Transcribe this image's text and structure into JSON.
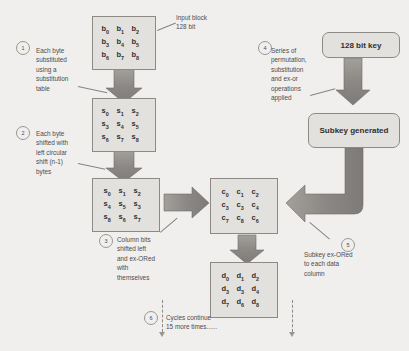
{
  "diagram": {
    "background_color": "#f1efed",
    "box_fill": "#e3e1de",
    "box_border": "#8d8a86",
    "arrow_color": "#8b8885"
  },
  "boxes": {
    "input_block": {
      "name": "input-block-matrix",
      "rows": [
        [
          "b0",
          "b1",
          "b2"
        ],
        [
          "b3",
          "b4",
          "b5"
        ],
        [
          "b6",
          "b7",
          "b8"
        ]
      ]
    },
    "substituted": {
      "name": "substituted-matrix",
      "rows": [
        [
          "s0",
          "s1",
          "s2"
        ],
        [
          "s3",
          "s4",
          "s5"
        ],
        [
          "s6",
          "s7",
          "s8"
        ]
      ]
    },
    "shifted": {
      "name": "shifted-matrix",
      "rows": [
        [
          "s0",
          "s1",
          "s2"
        ],
        [
          "s4",
          "s5",
          "s3"
        ],
        [
          "s8",
          "s6",
          "s7"
        ]
      ]
    },
    "mixed": {
      "name": "mixed-columns-matrix",
      "rows": [
        [
          "c0",
          "c1",
          "c2"
        ],
        [
          "c3",
          "c3",
          "c4"
        ],
        [
          "c7",
          "c8",
          "c6"
        ]
      ]
    },
    "output": {
      "name": "output-matrix",
      "rows": [
        [
          "d0",
          "d1",
          "d2"
        ],
        [
          "d3",
          "d3",
          "d4"
        ],
        [
          "d7",
          "d6",
          "d8"
        ]
      ]
    }
  },
  "key_blocks": {
    "cipher_key": "128 bit key",
    "subkey": "Subkey generated"
  },
  "annotations": {
    "input_label": "Input block\n128 bit"
  },
  "steps": [
    {
      "number": "1",
      "text": "Each byte\nsubstituted\nusing a\nsubstitution\ntable"
    },
    {
      "number": "2",
      "text": "Each byte\nshifted with\nleft circular\nshift (n-1)\nbytes"
    },
    {
      "number": "3",
      "text": "Column bits\nshifted left\nand ex-ORed\nwith\nthemselves"
    },
    {
      "number": "4",
      "text": "Series of\npermutation,\nsubstitution\nand ex-or\noperations\napplied"
    },
    {
      "number": "5",
      "text": "Subkey ex-ORed\nto each data\ncolumn"
    },
    {
      "number": "6",
      "text": "Cycles continue\n15 more times......"
    }
  ]
}
